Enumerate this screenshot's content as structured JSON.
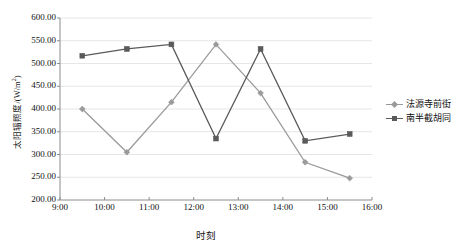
{
  "chart_data": {
    "type": "line",
    "title": "",
    "xlabel": "时刻",
    "ylabel": "太阳辐照度/(W/m2)",
    "ylabel_main": "太阳辐照度/(W/m",
    "ylabel_sup": "2",
    "ylabel_tail": ")",
    "x": [
      "9:30",
      "10:30",
      "11:30",
      "12:30",
      "13:30",
      "14:30",
      "15:30"
    ],
    "x_tick_labels": [
      "9:00",
      "10:00",
      "11:00",
      "12:00",
      "13:00",
      "14:00",
      "15:00",
      "16:00"
    ],
    "y_tick_labels": [
      "600.00",
      "550.00",
      "500.00",
      "450.00",
      "400.00",
      "350.00",
      "300.00",
      "250.00",
      "200.00"
    ],
    "y_tick_values": [
      600,
      550,
      500,
      450,
      400,
      350,
      300,
      250,
      200
    ],
    "ylim": [
      200,
      600
    ],
    "xlim": [
      "9:00",
      "16:00"
    ],
    "grid": true,
    "grid_axis": "y",
    "legend_position": "right",
    "series": [
      {
        "name": "法源寺前街",
        "color": "#9a9a9a",
        "marker": "diamond",
        "values": [
          400,
          305,
          415,
          542,
          435,
          283,
          248
        ]
      },
      {
        "name": "南半截胡同",
        "color": "#5a5a5a",
        "marker": "square",
        "values": [
          517,
          532,
          542,
          335,
          532,
          330,
          345
        ]
      }
    ]
  },
  "colors": {
    "axis": "#8c8c8c",
    "grid": "#e6e6e6",
    "text": "#111111",
    "series1": "#9a9a9a",
    "series2": "#5a5a5a",
    "background": "#ffffff"
  }
}
